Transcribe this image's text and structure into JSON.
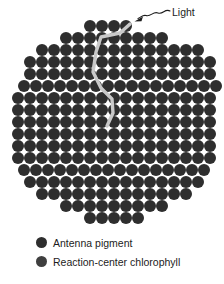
{
  "figure": {
    "name": "photosynthetic-antenna-complex",
    "background_color": "#ffffff"
  },
  "annotation": {
    "light_label": "Light",
    "light_arrow_icon": "wavy-arrow-icon",
    "energy_path_icon": "energy-transfer-path-icon",
    "energy_path_color": "#c9c9c9"
  },
  "legend": {
    "items": [
      {
        "label": "Antenna pigment",
        "color": "#2e2e2e",
        "swatch_icon": "filled-circle-icon"
      },
      {
        "label": "Reaction-center chlorophyll",
        "color": "#3f3f3f",
        "swatch_icon": "filled-circle-icon"
      }
    ]
  },
  "chart_data": {
    "type": "diagram",
    "pigment_color": "#2e2e2e",
    "reaction_center_color": "#3a3a3a",
    "grid_pitch_px": 12,
    "circle_diameter_px": 12.6,
    "disc_bounds_px": {
      "x_min": 14,
      "x_max": 212,
      "y_min": 21,
      "y_max": 228
    },
    "reaction_center": {
      "x": 107,
      "y": 128
    },
    "rows": [
      {
        "y": 26,
        "x_start": 90,
        "count": 4
      },
      {
        "y": 38,
        "x_start": 66,
        "count": 9
      },
      {
        "y": 50,
        "x_start": 42,
        "count": 14
      },
      {
        "y": 62,
        "x_start": 30,
        "count": 16
      },
      {
        "y": 74,
        "x_start": 30,
        "count": 16
      },
      {
        "y": 86,
        "x_start": 24,
        "count": 17
      },
      {
        "y": 98,
        "x_start": 18,
        "count": 17
      },
      {
        "y": 110,
        "x_start": 18,
        "count": 17
      },
      {
        "y": 122,
        "x_start": 18,
        "count": 17
      },
      {
        "y": 134,
        "x_start": 18,
        "count": 17
      },
      {
        "y": 146,
        "x_start": 18,
        "count": 17
      },
      {
        "y": 158,
        "x_start": 18,
        "count": 17
      },
      {
        "y": 170,
        "x_start": 24,
        "count": 16
      },
      {
        "y": 182,
        "x_start": 30,
        "count": 15
      },
      {
        "y": 194,
        "x_start": 42,
        "count": 13
      },
      {
        "y": 206,
        "x_start": 66,
        "count": 9
      },
      {
        "y": 218,
        "x_start": 90,
        "count": 5
      }
    ],
    "energy_path_points": [
      {
        "x": 130,
        "y": 24
      },
      {
        "x": 120,
        "y": 33
      },
      {
        "x": 101,
        "y": 37
      },
      {
        "x": 96,
        "y": 52
      },
      {
        "x": 93,
        "y": 72
      },
      {
        "x": 101,
        "y": 88
      },
      {
        "x": 112,
        "y": 99
      },
      {
        "x": 113,
        "y": 113
      },
      {
        "x": 107,
        "y": 126
      }
    ],
    "light_arrow": {
      "label": "Light",
      "tip": {
        "x": 136,
        "y": 21
      },
      "tail": {
        "x": 170,
        "y": 11
      }
    }
  }
}
